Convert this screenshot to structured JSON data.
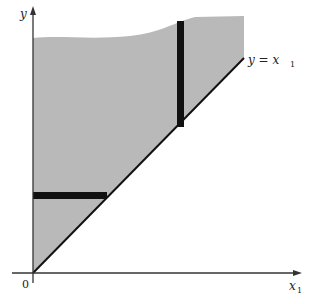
{
  "diagram": {
    "type": "region-of-integration",
    "region_color": "#b9b9b9",
    "bar_color": "#111111",
    "axis_color": "#333333",
    "labels": {
      "y_axis": "y",
      "x_axis_main": "x",
      "x_axis_sub": "1",
      "origin": "0",
      "line_main": "y = x",
      "line_sub": "1"
    },
    "elements": [
      {
        "name": "shaded-region",
        "description": "Region above the line y = x1, bounded by y-axis and an upper curve"
      },
      {
        "name": "diagonal-line",
        "description": "Line y = x1 from origin"
      },
      {
        "name": "horizontal-strip",
        "description": "Horizontal black bar from y-axis to diagonal"
      },
      {
        "name": "vertical-strip",
        "description": "Vertical black bar from diagonal to upper curve"
      }
    ]
  }
}
